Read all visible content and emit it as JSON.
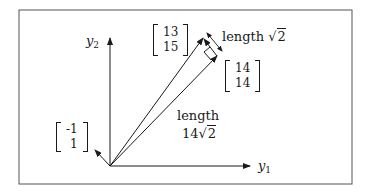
{
  "diagram": {
    "type": "vector-decomposition",
    "axes": {
      "horizontal": {
        "label": "y",
        "subscript": "1"
      },
      "vertical": {
        "label": "y",
        "subscript": "2"
      }
    },
    "vectors": [
      {
        "name": "b",
        "components": [
          "13",
          "15"
        ]
      },
      {
        "name": "projection",
        "components": [
          "14",
          "14"
        ]
      },
      {
        "name": "direction-perpendicular",
        "components": [
          "-1",
          "1"
        ]
      }
    ],
    "annotations": {
      "error_length": {
        "word": "length",
        "radicand": "2",
        "coefficient": ""
      },
      "projection_length": {
        "word": "length",
        "coefficient": "14",
        "radicand": "2"
      }
    },
    "colors": {
      "ink": "#1a1a1a",
      "frame": "#555555",
      "background": "#ffffff"
    }
  }
}
